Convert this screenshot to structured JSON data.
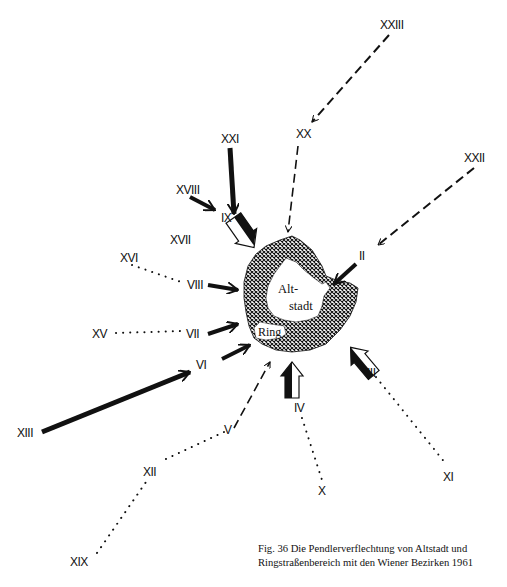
{
  "figure": {
    "caption_line1": "Fig. 36    Die Pendlerverflechtung von Altstadt und",
    "caption_line2": "Ringstraßenbereich  mit den Wiener Bezirken 1961",
    "center_labels": {
      "altstadt_line1": "Alt-",
      "altstadt_line2": "stadt",
      "ring": "Ring"
    },
    "colors": {
      "ink": "#111111",
      "background": "#ffffff"
    },
    "arrow_styles": {
      "solid_thin": "Strong commuter flow (solid black arrow)",
      "solid_thick": "Very strong flow (thick black arrow)",
      "block": "Reverse/outbound flow (block arrow, half black half white)",
      "dashed": "Weak flow (dashed arrow)",
      "dotted": "Connection to adjacent district (dotted line)"
    },
    "districts": [
      {
        "id": "II",
        "label": "II"
      },
      {
        "id": "III",
        "label": "III"
      },
      {
        "id": "IV",
        "label": "IV"
      },
      {
        "id": "V",
        "label": "V"
      },
      {
        "id": "VI",
        "label": "VI"
      },
      {
        "id": "VII",
        "label": "VII"
      },
      {
        "id": "VIII",
        "label": "VIII"
      },
      {
        "id": "IX",
        "label": "IX"
      },
      {
        "id": "X",
        "label": "X"
      },
      {
        "id": "XI",
        "label": "XI"
      },
      {
        "id": "XII",
        "label": "XII"
      },
      {
        "id": "XIII",
        "label": "XIII"
      },
      {
        "id": "XV",
        "label": "XV"
      },
      {
        "id": "XVI",
        "label": "XVI"
      },
      {
        "id": "XVII",
        "label": "XVII"
      },
      {
        "id": "XVIII",
        "label": "XVIII"
      },
      {
        "id": "XIX",
        "label": "XIX"
      },
      {
        "id": "XX",
        "label": "XX"
      },
      {
        "id": "XXI",
        "label": "XXI"
      },
      {
        "id": "XXII",
        "label": "XXII"
      },
      {
        "id": "XXIII",
        "label": "XXIII"
      }
    ],
    "connections": [
      {
        "from": "XXI",
        "to": "XX",
        "style": "dashed"
      },
      {
        "from": "XX",
        "to": "center",
        "style": "dashed"
      },
      {
        "from": "XXII",
        "to": "II",
        "style": "dashed"
      },
      {
        "from": "II",
        "to": "center",
        "style": "solid_thin"
      },
      {
        "from": "XIX",
        "to": "IX",
        "style": "solid_thick"
      },
      {
        "from": "XVIII",
        "to": "IX",
        "style": "solid_thin"
      },
      {
        "from": "IX",
        "to": "center",
        "style": "block"
      },
      {
        "from": "XVI",
        "to": "VIII",
        "style": "dotted"
      },
      {
        "from": "VIII",
        "to": "center",
        "style": "solid_thin"
      },
      {
        "from": "XV",
        "to": "VII",
        "style": "dotted"
      },
      {
        "from": "VII",
        "to": "center",
        "style": "solid_thin"
      },
      {
        "from": "VI",
        "to": "center",
        "style": "solid_thin"
      },
      {
        "from": "XIII",
        "to": "VI",
        "style": "solid_thick"
      },
      {
        "from": "XXIII",
        "to": "XII",
        "style": "dotted"
      },
      {
        "from": "XII",
        "to": "V",
        "style": "dotted"
      },
      {
        "from": "V",
        "to": "center",
        "style": "dashed"
      },
      {
        "from": "X",
        "to": "IV",
        "style": "dotted"
      },
      {
        "from": "IV",
        "to": "center",
        "style": "block"
      },
      {
        "from": "XI",
        "to": "III",
        "style": "dotted"
      },
      {
        "from": "III",
        "to": "center",
        "style": "block"
      }
    ]
  }
}
